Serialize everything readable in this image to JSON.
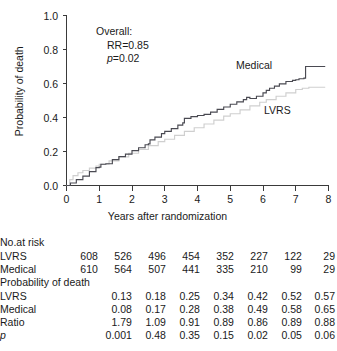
{
  "chart_data": {
    "type": "line",
    "title": "",
    "xlabel": "Years after randomization",
    "ylabel": "Probability of death",
    "xlim": [
      0,
      8
    ],
    "ylim": [
      0,
      1.0
    ],
    "xticks": [
      "0",
      "1",
      "2",
      "3",
      "4",
      "5",
      "6",
      "7",
      "8"
    ],
    "yticks": [
      "0.0",
      "0.2",
      "0.4",
      "0.6",
      "0.8",
      "1.0"
    ],
    "grid": false,
    "legend_position": "inline-curve-labels",
    "annotations": {
      "overall_header": "Overall:",
      "rr": "RR=0.85",
      "p_prefix": "p",
      "p_value": "=0.02"
    },
    "series": [
      {
        "name": "Medical",
        "color": "#4a4a52",
        "label_text": "Medical",
        "points_x": [
          0,
          0.12,
          0.3,
          0.5,
          0.7,
          0.78,
          0.9,
          1.0,
          1.05,
          1.2,
          1.4,
          1.6,
          1.8,
          2.0,
          2.2,
          2.4,
          2.5,
          2.55,
          2.7,
          2.9,
          3.0,
          3.2,
          3.4,
          3.55,
          3.6,
          3.8,
          4.0,
          4.2,
          4.4,
          4.6,
          4.8,
          5.0,
          5.2,
          5.4,
          5.5,
          5.6,
          5.8,
          6.0,
          6.1,
          6.2,
          6.35,
          6.5,
          6.7,
          6.9,
          7.0,
          7.1,
          7.25,
          7.3,
          7.9
        ],
        "points_y": [
          0.0,
          0.015,
          0.035,
          0.055,
          0.082,
          0.082,
          0.105,
          0.108,
          0.125,
          0.128,
          0.152,
          0.17,
          0.185,
          0.205,
          0.222,
          0.24,
          0.245,
          0.268,
          0.285,
          0.305,
          0.318,
          0.335,
          0.355,
          0.368,
          0.395,
          0.405,
          0.412,
          0.418,
          0.432,
          0.448,
          0.462,
          0.478,
          0.492,
          0.505,
          0.518,
          0.512,
          0.525,
          0.545,
          0.56,
          0.572,
          0.585,
          0.598,
          0.612,
          0.618,
          0.622,
          0.628,
          0.632,
          0.7,
          0.7
        ]
      },
      {
        "name": "LVRS",
        "color": "#cfcfcf",
        "label_text": "LVRS",
        "points_x": [
          0,
          0.1,
          0.2,
          0.35,
          0.5,
          0.7,
          0.9,
          1.0,
          1.3,
          1.6,
          1.9,
          2.2,
          2.5,
          2.8,
          3.0,
          3.3,
          3.6,
          3.9,
          4.2,
          4.5,
          4.8,
          5.0,
          5.3,
          5.6,
          5.9,
          6.1,
          6.4,
          6.7,
          7.0,
          7.2,
          7.4,
          7.9
        ],
        "points_y": [
          0.0,
          0.035,
          0.058,
          0.075,
          0.088,
          0.102,
          0.115,
          0.125,
          0.145,
          0.168,
          0.19,
          0.212,
          0.235,
          0.258,
          0.272,
          0.295,
          0.318,
          0.34,
          0.362,
          0.385,
          0.408,
          0.422,
          0.445,
          0.468,
          0.49,
          0.505,
          0.525,
          0.545,
          0.565,
          0.572,
          0.578,
          0.578
        ]
      }
    ]
  },
  "table": {
    "sections": [
      {
        "header": "No.at risk",
        "rows": [
          {
            "label": "LVRS",
            "values": [
              "608",
              "526",
              "496",
              "454",
              "352",
              "227",
              "122",
              "29"
            ]
          },
          {
            "label": "Medical",
            "values": [
              "610",
              "564",
              "507",
              "441",
              "335",
              "210",
              "99",
              "29"
            ]
          }
        ]
      },
      {
        "header": "Probability of death",
        "rows": [
          {
            "label": "LVRS",
            "values": [
              "",
              "0.13",
              "0.18",
              "0.25",
              "0.34",
              "0.42",
              "0.52",
              "0.57"
            ]
          },
          {
            "label": "Medical",
            "values": [
              "",
              "0.08",
              "0.17",
              "0.28",
              "0.38",
              "0.49",
              "0.58",
              "0.65"
            ]
          },
          {
            "label": "Ratio",
            "values": [
              "",
              "1.79",
              "1.09",
              "0.91",
              "0.89",
              "0.86",
              "0.89",
              "0.88"
            ]
          },
          {
            "label": "p",
            "italic_label": true,
            "values": [
              "",
              "0.001",
              "0.48",
              "0.35",
              "0.15",
              "0.02",
              "0.05",
              "0.06"
            ]
          }
        ]
      }
    ]
  }
}
